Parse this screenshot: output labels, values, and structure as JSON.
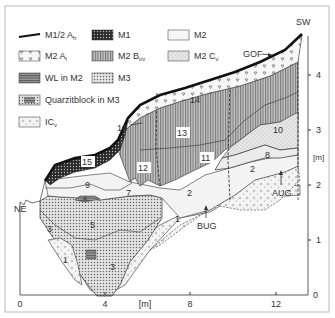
{
  "orientation": {
    "left": "NE",
    "right": "SW"
  },
  "legend": [
    {
      "id": "m12ah",
      "label": "M1/2 A",
      "sub": "h"
    },
    {
      "id": "m1",
      "label": "M1",
      "sub": ""
    },
    {
      "id": "m2",
      "label": "M2",
      "sub": ""
    },
    {
      "id": "m2ai",
      "label": "M2 A",
      "sub": "l"
    },
    {
      "id": "m2bt",
      "label": "M2 B",
      "sub": "t/v"
    },
    {
      "id": "m2cv",
      "label": "M2 C",
      "sub": "v"
    },
    {
      "id": "wl",
      "label": "WL in M2",
      "sub": ""
    },
    {
      "id": "m3",
      "label": "M3",
      "sub": ""
    },
    {
      "id": "quarz",
      "label": "Quarzitblock in M3",
      "sub": ""
    },
    {
      "id": "icv",
      "label": "IC",
      "sub": "v"
    }
  ],
  "axes": {
    "x_unit": "[m]",
    "y_unit": "[m]",
    "x_ticks": [
      "0",
      "4",
      "8",
      "12"
    ],
    "y_ticks": [
      "0",
      "1",
      "2",
      "3",
      "4"
    ]
  },
  "annotations": {
    "gof": "GOF",
    "aug": "AUG",
    "bug": "BUG"
  },
  "unit_numbers": [
    "1",
    "1",
    "2",
    "2",
    "3",
    "3",
    "4",
    "5",
    "7",
    "8",
    "9",
    "10",
    "11",
    "12",
    "13",
    "14",
    "15",
    "16"
  ],
  "colors": {
    "line": "#1a1a1a",
    "m1": "#4a4a4a",
    "m2": "#f2f2f2",
    "m2bt": "#9a9a9a",
    "m2cv": "#dcdcdc",
    "wl": "#8a8a8a",
    "m3": "#c8c8c8"
  }
}
